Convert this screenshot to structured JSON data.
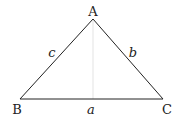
{
  "diagram": {
    "type": "triangle",
    "vertices": {
      "A": {
        "label": "A",
        "x": 93,
        "y": 19
      },
      "B": {
        "label": "B",
        "x": 20,
        "y": 99
      },
      "C": {
        "label": "C",
        "x": 163,
        "y": 99
      }
    },
    "sides": {
      "a": {
        "label": "a"
      },
      "b": {
        "label": "b"
      },
      "c": {
        "label": "c"
      }
    },
    "colors": {
      "stroke": "#222222",
      "altitude": "#d8d8d8"
    }
  }
}
